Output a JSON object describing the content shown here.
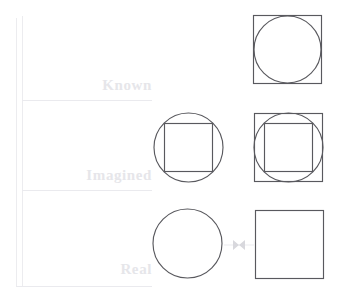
{
  "figure": {
    "width": 340,
    "height": 302,
    "background": "#ffffff",
    "shape_stroke_color": "#59595e",
    "rule_color": "#ececef",
    "label_color": "#e6e6ea",
    "connector_color": "#d8d8dd"
  },
  "axis": {
    "vertical_rules": [
      {
        "name": "outer-vertical-rule",
        "x": 16,
        "y": 18,
        "height": 268
      },
      {
        "name": "inner-vertical-rule",
        "x": 22,
        "y": 16,
        "height": 270
      }
    ],
    "horizontal_rules": [
      {
        "name": "divider-known-imagined",
        "x": 22,
        "y": 100,
        "width": 130
      },
      {
        "name": "divider-imagined-real",
        "x": 22,
        "y": 190,
        "width": 130
      },
      {
        "name": "divider-baseline",
        "x": 16,
        "y": 286,
        "width": 136
      }
    ]
  },
  "rows": [
    {
      "key": "known",
      "label": "Known",
      "label_x": 66,
      "label_y": 78,
      "band_top": 16,
      "band_bottom": 100
    },
    {
      "key": "imagined",
      "label": "Imagined",
      "label_x": 42,
      "label_y": 168,
      "band_top": 100,
      "band_bottom": 190
    },
    {
      "key": "real",
      "label": "Real",
      "label_x": 84,
      "label_y": 262,
      "band_top": 190,
      "band_bottom": 286
    }
  ],
  "cells": [
    {
      "name": "known-right-cell",
      "row": "known",
      "column": "right",
      "x": 252,
      "y": 14,
      "width": 72,
      "height": 72,
      "description": "square with inscribed circle",
      "shapes": [
        {
          "type": "rect",
          "name": "outer-square",
          "x": 1.5,
          "y": 1.5,
          "width": 68,
          "height": 68
        },
        {
          "type": "circle",
          "name": "inscribed-circle",
          "cx": 35.5,
          "cy": 35.5,
          "r": 33.5
        }
      ]
    },
    {
      "name": "imagined-middle-cell",
      "row": "imagined",
      "column": "middle",
      "x": 152,
      "y": 110,
      "width": 74,
      "height": 76,
      "description": "circle with inscribed square",
      "shapes": [
        {
          "type": "circle",
          "name": "outer-circle",
          "cx": 36.5,
          "cy": 37.5,
          "r": 34.5
        },
        {
          "type": "rect",
          "name": "inscribed-square",
          "x": 12.5,
          "y": 13.5,
          "width": 48,
          "height": 48
        }
      ]
    },
    {
      "name": "imagined-right-cell",
      "row": "imagined",
      "column": "right",
      "x": 252,
      "y": 110,
      "width": 74,
      "height": 76,
      "description": "square containing circle containing inner square",
      "shapes": [
        {
          "type": "rect",
          "name": "outer-square",
          "x": 2.5,
          "y": 3.5,
          "width": 68,
          "height": 68
        },
        {
          "type": "circle",
          "name": "middle-circle",
          "cx": 36.5,
          "cy": 37.5,
          "r": 34.5
        },
        {
          "type": "rect",
          "name": "inner-square",
          "x": 12.5,
          "y": 13.5,
          "width": 48,
          "height": 48
        }
      ]
    },
    {
      "name": "real-middle-cell",
      "row": "real",
      "column": "middle",
      "x": 151,
      "y": 206,
      "width": 74,
      "height": 76,
      "description": "plain circle",
      "shapes": [
        {
          "type": "circle",
          "name": "circle",
          "cx": 36.5,
          "cy": 37.5,
          "r": 34.5
        }
      ]
    },
    {
      "name": "real-right-cell",
      "row": "real",
      "column": "right",
      "x": 253,
      "y": 208,
      "width": 72,
      "height": 74,
      "description": "plain square",
      "shapes": [
        {
          "type": "rect",
          "name": "square",
          "x": 2.5,
          "y": 2.5,
          "width": 68,
          "height": 68
        }
      ]
    }
  ],
  "connector": {
    "name": "circle-square-connector",
    "description": "bowtie glyph linking the real circle and the real square",
    "x": 224,
    "y": 238,
    "width": 30,
    "height": 14
  }
}
